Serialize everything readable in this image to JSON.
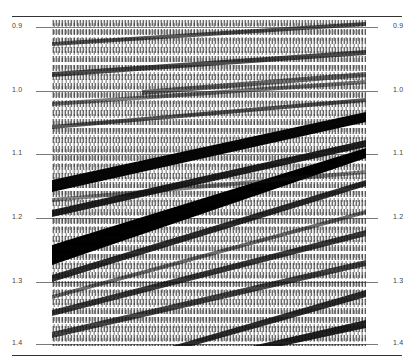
{
  "figure": {
    "type": "seismic-section",
    "time_axis_label_unit": "s",
    "time_ticks_left": [
      "0.9",
      "1.0",
      "1.1",
      "1.2",
      "1.3",
      "1.4"
    ],
    "time_ticks_right": [
      "0.9",
      "1.0",
      "1.1",
      "1.2",
      "1.3",
      "1.4"
    ],
    "tick_y_px": [
      27,
      91,
      154,
      218,
      282,
      344
    ],
    "reflector_dip": "rising left-to-right",
    "colors": {
      "trace_fill": "#0a0a0a",
      "background": "#ffffff",
      "timing_line": "#7a7a7a",
      "rule": "#333333"
    }
  }
}
